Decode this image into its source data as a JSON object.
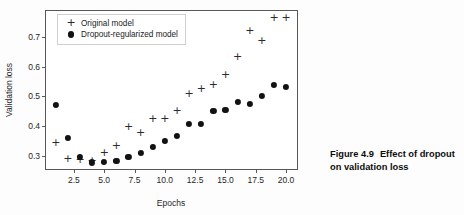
{
  "caption": {
    "figure_number": "Figure 4.9",
    "text": "Effect of dropout on validation loss"
  },
  "legend": {
    "position": "upper-left-inside",
    "entries": [
      {
        "label": "Original model",
        "marker": "plus-marker-icon",
        "color": "#2b2b2b"
      },
      {
        "label": "Dropout-regularized model",
        "marker": "filled-circle-marker-icon",
        "color": "#121212"
      }
    ]
  },
  "chart_data": {
    "type": "scatter",
    "title": "",
    "xlabel": "Epochs",
    "ylabel": "Validation loss",
    "xlim": [
      0.2,
      20.9
    ],
    "ylim": [
      0.255,
      0.788
    ],
    "grid": false,
    "xticks": [
      "2.5",
      "5.0",
      "7.5",
      "10.0",
      "12.5",
      "15.0",
      "17.5",
      "20.0"
    ],
    "xtick_values": [
      2.5,
      5.0,
      7.5,
      10.0,
      12.5,
      15.0,
      17.5,
      20.0
    ],
    "yticks": [
      "0.3",
      "0.4",
      "0.5",
      "0.6",
      "0.7"
    ],
    "ytick_values": [
      0.3,
      0.4,
      0.5,
      0.6,
      0.7
    ],
    "x": [
      1,
      2,
      3,
      4,
      5,
      6,
      7,
      8,
      9,
      10,
      11,
      12,
      13,
      14,
      15,
      16,
      17,
      18,
      19,
      20
    ],
    "series": [
      {
        "name": "Original model",
        "marker": "plus",
        "color": "#2b2b2b",
        "values": [
          0.343,
          0.288,
          0.287,
          0.283,
          0.31,
          0.333,
          0.396,
          0.377,
          0.422,
          0.422,
          0.449,
          0.507,
          0.525,
          0.54,
          0.573,
          0.633,
          0.722,
          0.688,
          0.765,
          0.765
        ]
      },
      {
        "name": "Dropout-regularized model",
        "marker": "circle",
        "color": "#121212",
        "values": [
          0.47,
          0.36,
          0.295,
          0.277,
          0.28,
          0.282,
          0.296,
          0.308,
          0.329,
          0.351,
          0.366,
          0.407,
          0.407,
          0.452,
          0.454,
          0.481,
          0.475,
          0.501,
          0.54,
          0.531
        ]
      }
    ]
  }
}
